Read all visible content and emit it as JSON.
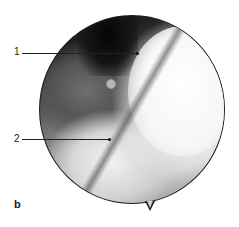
{
  "figure": {
    "panel_label": "b",
    "image_type": "circular endoscopic view, grayscale",
    "labels": [
      {
        "number": "1"
      },
      {
        "number": "2"
      }
    ]
  }
}
